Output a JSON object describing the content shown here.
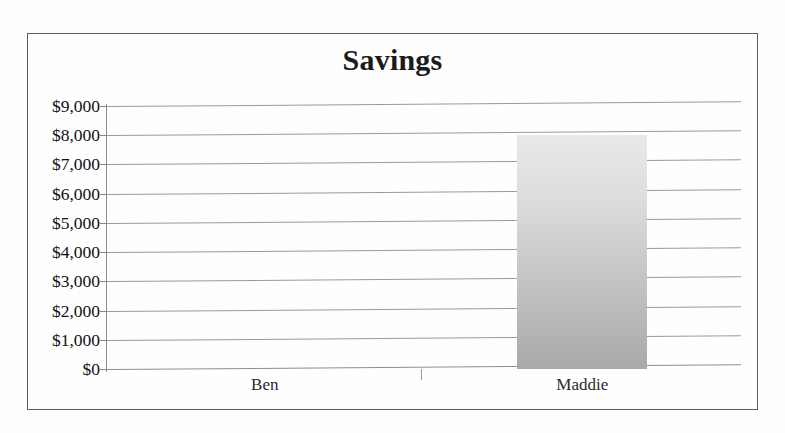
{
  "chart_data": {
    "type": "bar",
    "title": "Savings",
    "xlabel": "",
    "ylabel": "",
    "categories": [
      "Ben",
      "Maddie"
    ],
    "values": [
      0,
      8000
    ],
    "series": [
      {
        "name": "Savings",
        "values": [
          0,
          8000
        ]
      }
    ],
    "ylim": [
      0,
      9000
    ],
    "ytick_step": 1000,
    "ytick_labels": [
      "$9,000",
      "$8,000",
      "$7,000",
      "$6,000",
      "$5,000",
      "$4,000",
      "$3,000",
      "$2,000",
      "$1,000",
      "$0"
    ],
    "ytick_values": [
      9000,
      8000,
      7000,
      6000,
      5000,
      4000,
      3000,
      2000,
      1000,
      0
    ],
    "grid": true,
    "legend": false,
    "legend_position": "none",
    "annotations": []
  },
  "style": {
    "bar_fill_top": "#e9e9e9",
    "bar_fill_bottom": "#a9a9a9",
    "gridline_color": "#9a9a9a",
    "axis_color": "#8a8a8a",
    "frame_color": "#5d5d5d",
    "title_color": "#1b1b1b",
    "label_color": "#111111",
    "page_background": "#fdfdfc",
    "plot_background": "#fefefe"
  }
}
